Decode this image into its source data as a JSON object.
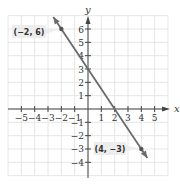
{
  "chart_data": {
    "type": "line",
    "title": "",
    "xlabel": "x",
    "ylabel": "y",
    "xlim": [
      -6,
      6
    ],
    "ylim": [
      -5,
      7
    ],
    "grid": true,
    "x_ticks": [
      -5,
      -4,
      -3,
      -2,
      -1,
      1,
      2,
      3,
      4,
      5
    ],
    "y_ticks": [
      -4,
      -3,
      -2,
      -1,
      1,
      2,
      3,
      4,
      5,
      6
    ],
    "x_tick_labels": [
      "−5",
      "−4",
      "−3",
      "−2",
      "−1",
      "1",
      "2",
      "3",
      "4",
      "5"
    ],
    "y_tick_labels": [
      "−4",
      "−3",
      "−2",
      "−1",
      "1",
      "2",
      "3",
      "4",
      "5",
      "6"
    ],
    "series": [
      {
        "name": "line through (-2, 6) and (4, -3)",
        "x": [
          -2,
          4
        ],
        "y": [
          6,
          -3
        ],
        "slope": -1.5,
        "y_intercept": 3,
        "x_intercept": 2
      }
    ],
    "annotations": [
      {
        "text": "(−2, 6)",
        "x": -2,
        "y": 6
      },
      {
        "text": "(4, −3)",
        "x": 4,
        "y": -3
      }
    ],
    "colors": {
      "line": "#6b6b6b",
      "grid": "#e6e6e6",
      "axis": "#444444",
      "label_box": "#ededed"
    }
  }
}
